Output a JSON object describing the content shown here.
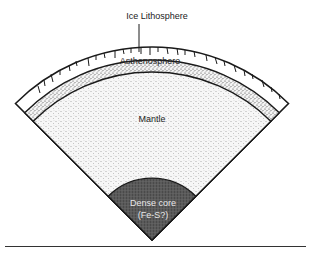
{
  "diagram": {
    "type": "planetary-interior-cross-section",
    "labels": {
      "ice_lithosphere": "Ice Lithosphere",
      "asthenosphere": "Asthenosphere",
      "mantle": "Mantle",
      "core_line1": "Dense core",
      "core_line2": "(Fe-S?)"
    },
    "layers": [
      {
        "name": "Ice Lithosphere",
        "fill": "#ffffff"
      },
      {
        "name": "Asthenosphere",
        "fill": "#d8d8d8"
      },
      {
        "name": "Mantle",
        "fill": "#ececec"
      },
      {
        "name": "Dense core (Fe-S?)",
        "fill": "#555555"
      }
    ],
    "colors": {
      "outline": "#1a1a1a",
      "baseline": "#333333"
    }
  }
}
